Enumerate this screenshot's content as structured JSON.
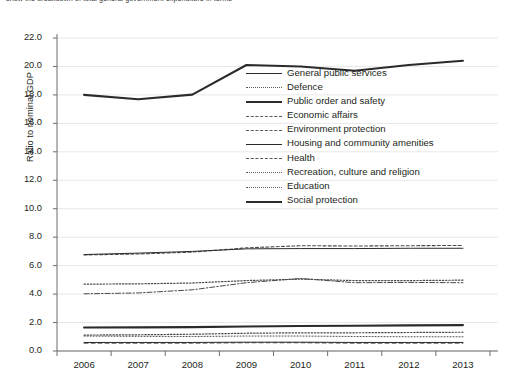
{
  "caption": "show the breakdown of total general government expenditure in terms",
  "axes": {
    "ylabel": "Ratio to nominal GDP",
    "yticks": [
      "0.0",
      "2.0",
      "4.0",
      "6.0",
      "8.0",
      "10.0",
      "12.0",
      "14.0",
      "16.0",
      "18.0",
      "20.0",
      "22.0"
    ],
    "xticks": [
      "2006",
      "2007",
      "2008",
      "2009",
      "2010",
      "2011",
      "2012",
      "2013"
    ]
  },
  "legend": [
    {
      "label": "General public services",
      "style": "solid-thin"
    },
    {
      "label": "Defence",
      "style": "dotted-fine"
    },
    {
      "label": "Public order and safety",
      "style": "solid-bold"
    },
    {
      "label": "Economic affairs",
      "style": "dashdot"
    },
    {
      "label": "Environment protection",
      "style": "dashed"
    },
    {
      "label": "Housing and community amenities",
      "style": "solid-thin"
    },
    {
      "label": "Health",
      "style": "dashed-medium"
    },
    {
      "label": "Recreation, culture and religion",
      "style": "dotted"
    },
    {
      "label": "Education",
      "style": "dotted"
    },
    {
      "label": "Social protection",
      "style": "solid-bold"
    }
  ],
  "chart_data": {
    "type": "line",
    "title": "",
    "xlabel": "",
    "ylabel": "Ratio to nominal GDP",
    "x": [
      2006,
      2007,
      2008,
      2009,
      2010,
      2011,
      2012,
      2013
    ],
    "ylim": [
      0.0,
      22.0
    ],
    "ytick_step": 2.0,
    "grid": true,
    "legend_position": "inside-upper-right",
    "series": [
      {
        "name": "General public services",
        "style": "dotted",
        "values": [
          4.7,
          4.72,
          4.78,
          4.95,
          5.05,
          4.95,
          4.95,
          4.98
        ]
      },
      {
        "name": "Defence",
        "style": "dotted-fine",
        "values": [
          1.05,
          1.03,
          1.02,
          1.05,
          1.05,
          1.02,
          1.0,
          1.0
        ]
      },
      {
        "name": "Public order and safety",
        "style": "solid-bold",
        "values": [
          1.65,
          1.66,
          1.68,
          1.72,
          1.76,
          1.78,
          1.8,
          1.82
        ]
      },
      {
        "name": "Economic affairs",
        "style": "dashdot",
        "values": [
          4.02,
          4.08,
          4.3,
          4.8,
          5.1,
          4.8,
          4.82,
          4.8
        ]
      },
      {
        "name": "Environment protection",
        "style": "dashed",
        "values": [
          0.55,
          0.55,
          0.55,
          0.58,
          0.58,
          0.55,
          0.55,
          0.55
        ]
      },
      {
        "name": "Housing and community amenities",
        "style": "solid-thin",
        "values": [
          0.6,
          0.6,
          0.6,
          0.62,
          0.62,
          0.6,
          0.6,
          0.6
        ]
      },
      {
        "name": "Health",
        "style": "dashed-medium",
        "values": [
          6.75,
          6.82,
          6.95,
          7.25,
          7.4,
          7.38,
          7.4,
          7.42
        ]
      },
      {
        "name": "Recreation, culture and religion",
        "style": "dotted",
        "values": [
          1.12,
          1.14,
          1.18,
          1.25,
          1.28,
          1.28,
          1.3,
          1.32
        ]
      },
      {
        "name": "Education",
        "style": "solid-thin",
        "values": [
          6.78,
          6.88,
          7.0,
          7.18,
          7.2,
          7.2,
          7.22,
          7.22
        ]
      },
      {
        "name": "Social protection",
        "style": "solid-bold",
        "values": [
          18.0,
          17.7,
          18.02,
          20.1,
          20.0,
          19.7,
          20.1,
          20.4
        ]
      }
    ]
  }
}
